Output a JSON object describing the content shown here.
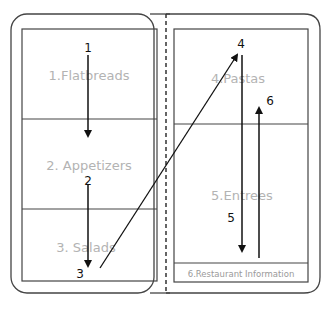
{
  "left_page": {
    "sections": [
      {
        "label": "1.Flatbreads"
      },
      {
        "label": "2. Appetizers"
      },
      {
        "label": "3. Salads"
      }
    ]
  },
  "right_page": {
    "sections": [
      {
        "label": "4.Pastas"
      },
      {
        "label": "5.Entrees"
      },
      {
        "label": "6.Restaurant Information"
      }
    ]
  },
  "steps": [
    {
      "label": "1"
    },
    {
      "label": "2"
    },
    {
      "label": "3"
    },
    {
      "label": "4"
    },
    {
      "label": "5"
    },
    {
      "label": "6"
    }
  ],
  "colors": {
    "stroke": "#333333",
    "arrow": "#111111",
    "section_text": "#b3b3b3"
  }
}
